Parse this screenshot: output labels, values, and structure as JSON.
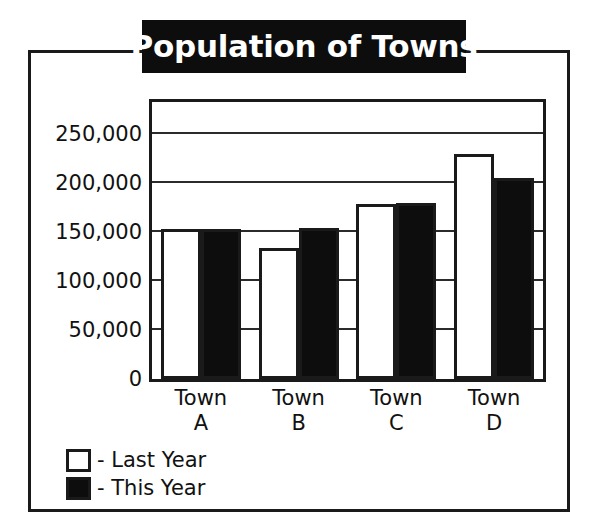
{
  "chart_data": {
    "type": "bar",
    "title": "Population of Towns",
    "xlabel": "",
    "ylabel": "",
    "categories": [
      "Town A",
      "Town B",
      "Town C",
      "Town D"
    ],
    "category_lines": [
      {
        "line1": "Town",
        "line2": "A"
      },
      {
        "line1": "Town",
        "line2": "B"
      },
      {
        "line1": "Town",
        "line2": "C"
      },
      {
        "line1": "Town",
        "line2": "D"
      }
    ],
    "series": [
      {
        "name": "- Last Year",
        "legend_label": "- Last Year",
        "color": "#ffffff",
        "values": [
          150000,
          131000,
          176000,
          227000
        ]
      },
      {
        "name": "- This Year",
        "legend_label": "- This Year",
        "color": "#0d0d0d",
        "values": [
          150000,
          151000,
          177000,
          202000
        ]
      }
    ],
    "ylim": [
      0,
      283000
    ],
    "yticks": [
      0,
      50000,
      100000,
      150000,
      200000,
      250000
    ],
    "ytick_labels": [
      "0",
      "50,000",
      "100,000",
      "150,000",
      "200,000",
      "250,000"
    ],
    "grid": true,
    "legend_position": "bottom-left",
    "annotations": []
  },
  "colors": {
    "ink": "#1a1a1a",
    "banner_background": "#0d0d0d",
    "banner_text": "#ffffff",
    "page_background": "#ffffff"
  }
}
